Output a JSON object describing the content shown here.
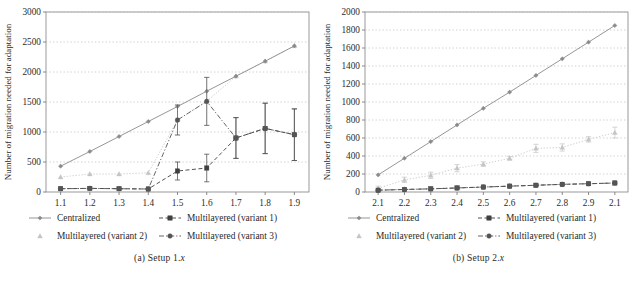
{
  "figure": {
    "panels": [
      {
        "caption_prefix": "(a)",
        "caption_text": "Setup 1.",
        "caption_italic": "x"
      },
      {
        "caption_prefix": "(b)",
        "caption_text": "Setup 2.",
        "caption_italic": "x"
      }
    ],
    "legend": {
      "entries": [
        {
          "label": "Centralized",
          "marker": "diamond-marker",
          "line": "solid",
          "color": "#8a8a8a"
        },
        {
          "label": "Multilayered (variant 1)",
          "marker": "square-marker",
          "line": "dashed",
          "color": "#4d4d4d"
        },
        {
          "label": "Multilayered (variant 2)",
          "marker": "triangle-marker",
          "line": "dotted",
          "color": "#c0c0c0"
        },
        {
          "label": "Multilayered (variant 3)",
          "marker": "circle-marker",
          "line": "dashdot",
          "color": "#5a5a5a"
        }
      ]
    }
  },
  "chart_data": [
    {
      "type": "line",
      "title": "(a) Setup 1.x",
      "xlabel": "",
      "ylabel": "Number of migration needed for adaptation",
      "categories": [
        "1.1",
        "1.2",
        "1.3",
        "1.4",
        "1.5",
        "1.6",
        "1.7",
        "1.8",
        "1.9"
      ],
      "ylim": [
        0,
        3000
      ],
      "yticks": [
        0,
        500,
        1000,
        1500,
        2000,
        2500,
        3000
      ],
      "grid": true,
      "legend_position": "below",
      "series": [
        {
          "name": "Centralized",
          "values": [
            430,
            675,
            925,
            1175,
            1425,
            1680,
            1930,
            2180,
            2435
          ],
          "errors": [
            0,
            0,
            0,
            0,
            0,
            0,
            0,
            0,
            0
          ]
        },
        {
          "name": "Multilayered (variant 1)",
          "values": [
            55,
            60,
            55,
            50,
            350,
            400,
            900,
            1060,
            955
          ],
          "errors": [
            0,
            0,
            0,
            0,
            150,
            230,
            340,
            420,
            430
          ]
        },
        {
          "name": "Multilayered (variant 2)",
          "values": [
            250,
            300,
            300,
            320,
            1200,
            1510,
            1930,
            2180,
            2435
          ],
          "errors": [
            0,
            0,
            0,
            0,
            250,
            400,
            0,
            0,
            0
          ]
        },
        {
          "name": "Multilayered (variant 3)",
          "values": [
            55,
            60,
            55,
            50,
            1200,
            1510,
            900,
            1060,
            955
          ],
          "errors": [
            0,
            0,
            0,
            0,
            250,
            400,
            340,
            420,
            430
          ]
        }
      ]
    },
    {
      "type": "line",
      "title": "(b) Setup 2.x",
      "xlabel": "",
      "ylabel": "Number of migration needed for adaptation",
      "categories": [
        "2.1",
        "2.2",
        "2.3",
        "2.4",
        "2.5",
        "2.6",
        "2.7",
        "2.8",
        "2.9",
        "2.1"
      ],
      "ylim": [
        0,
        2000
      ],
      "yticks": [
        0,
        200,
        400,
        600,
        800,
        1000,
        1200,
        1400,
        1600,
        1800,
        2000
      ],
      "grid": true,
      "legend_position": "below",
      "series": [
        {
          "name": "Centralized",
          "values": [
            190,
            375,
            560,
            745,
            930,
            1110,
            1295,
            1480,
            1665,
            1850
          ],
          "errors": [
            0,
            0,
            0,
            0,
            0,
            0,
            0,
            0,
            0,
            0
          ]
        },
        {
          "name": "Multilayered (variant 1)",
          "values": [
            20,
            28,
            35,
            45,
            55,
            65,
            75,
            85,
            92,
            100
          ],
          "errors": [
            0,
            0,
            0,
            0,
            0,
            0,
            0,
            0,
            0,
            0
          ]
        },
        {
          "name": "Multilayered (variant 2)",
          "values": [
            40,
            135,
            185,
            265,
            310,
            375,
            485,
            495,
            585,
            660
          ],
          "errors": [
            25,
            30,
            35,
            40,
            25,
            20,
            45,
            40,
            30,
            60
          ]
        },
        {
          "name": "Multilayered (variant 3)",
          "values": [
            20,
            28,
            35,
            45,
            55,
            65,
            75,
            85,
            92,
            100
          ],
          "errors": [
            0,
            0,
            0,
            0,
            0,
            0,
            0,
            0,
            0,
            0
          ]
        }
      ]
    }
  ]
}
